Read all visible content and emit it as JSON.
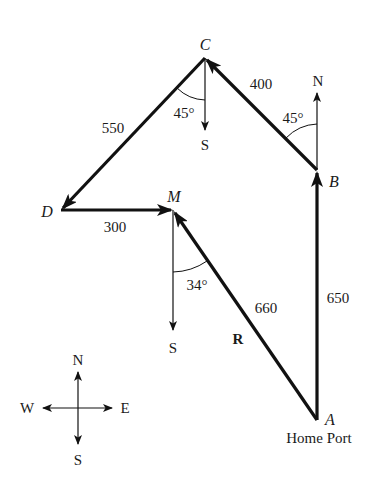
{
  "diagram": {
    "type": "vector-navigation-diagram",
    "points": {
      "A": {
        "label": "A",
        "note": "Home Port"
      },
      "B": {
        "label": "B"
      },
      "C": {
        "label": "C"
      },
      "D": {
        "label": "D"
      },
      "M": {
        "label": "M"
      }
    },
    "legs": [
      {
        "from": "A",
        "to": "B",
        "length": "650"
      },
      {
        "from": "B",
        "to": "C",
        "length": "400",
        "angle": "45°",
        "angle_ref": "N"
      },
      {
        "from": "C",
        "to": "D",
        "length": "550",
        "angle": "45°",
        "angle_ref": "S"
      },
      {
        "from": "D",
        "to": "M",
        "length": "300"
      }
    ],
    "resultant": {
      "label": "R",
      "from": "A",
      "to": "M",
      "length": "660",
      "angle": "34°",
      "angle_ref": "S"
    },
    "direction_labels": {
      "north_at_B": "N",
      "south_at_C": "S",
      "south_at_M": "S"
    },
    "compass": {
      "north": "N",
      "south": "S",
      "east": "E",
      "west": "W"
    },
    "home_port_label": "Home Port",
    "colors": {
      "line": "#111111",
      "background": "#ffffff"
    }
  }
}
